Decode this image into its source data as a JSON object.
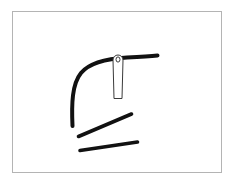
{
  "canvas": {
    "width": 246,
    "height": 190,
    "background_color": "#ffffff",
    "title": "needle and thread line sketch"
  },
  "frame": {
    "name": "drawing-frame",
    "x": 12,
    "y": 11,
    "width": 210,
    "height": 162,
    "border_color": "#b4b4b4",
    "border_width": 1,
    "fill_color": "#ffffff"
  },
  "drawing": {
    "stroke_color": "#111111",
    "outline_color": "#3a3a3a",
    "fill_color": "#ffffff",
    "strokes": [
      {
        "name": "curved-thread-stroke",
        "type": "path",
        "description": "long curved line rising from lower left, bending right across the top",
        "d": "M 72.5 126 C 71.5 104, 72 84, 81 73 C 90 62, 110 58.5, 127 57.5 C 139 56.8, 149 56.2, 157.5 55.5",
        "stroke_width": 4.0
      },
      {
        "name": "upper-diagonal-stroke",
        "type": "line",
        "description": "upper short diagonal line rising to the right",
        "x1": 78.5,
        "y1": 136.5,
        "x2": 131.5,
        "y2": 114.0,
        "stroke_width": 3.6
      },
      {
        "name": "lower-diagonal-stroke",
        "type": "line",
        "description": "lower nearly horizontal line tilting up to the right",
        "x1": 80.0,
        "y1": 150.5,
        "x2": 137.5,
        "y2": 142.0,
        "stroke_width": 3.6
      }
    ],
    "needle": {
      "name": "needle-shape",
      "description": "thin vertical needle with rounded eye loop at top, drawn in outline over the curved thread",
      "eye_center_x": 118.0,
      "eye_center_y": 60.0,
      "eye_outer_rx": 5.0,
      "eye_inner_rx": 2.0,
      "shaft_top_y": 60.0,
      "shaft_bottom_y": 98.5,
      "shaft_half_width": 4.0,
      "outline_width": 1.0
    }
  }
}
